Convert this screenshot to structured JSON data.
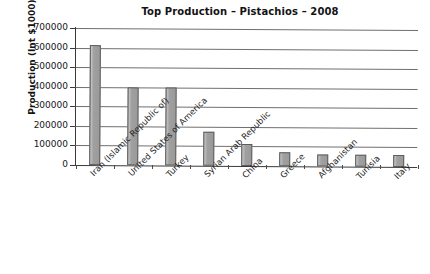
{
  "chart_data": {
    "type": "bar",
    "title": "Top Production – Pistachios – 2008",
    "xlabel": "",
    "ylabel": "Production (Int $1000)",
    "ylim": [
      0,
      700000
    ],
    "ytick_interval": 100000,
    "ytick_labels": [
      "700000",
      "600000",
      "500000",
      "400000",
      "300000",
      "200000",
      "100000",
      "0"
    ],
    "ytick_values": [
      700000,
      600000,
      500000,
      400000,
      300000,
      200000,
      100000,
      0
    ],
    "grid": true,
    "legend": "none",
    "categories": [
      "Iran (Islamic Republic of)",
      "United States of America",
      "Turkey",
      "Syrian Arab Republic",
      "China",
      "Greece",
      "Afghanistan",
      "Tunisia",
      "Italy"
    ],
    "values": [
      615000,
      400000,
      400000,
      173000,
      112000,
      70000,
      62000,
      60000,
      62000
    ],
    "bar_color": "#a3a3a3",
    "bar_edge_color": "#5d5d5d"
  },
  "axes": {
    "title": "Top Production – Pistachios – 2008",
    "y_axis_title": "Production (Int $1000)"
  }
}
